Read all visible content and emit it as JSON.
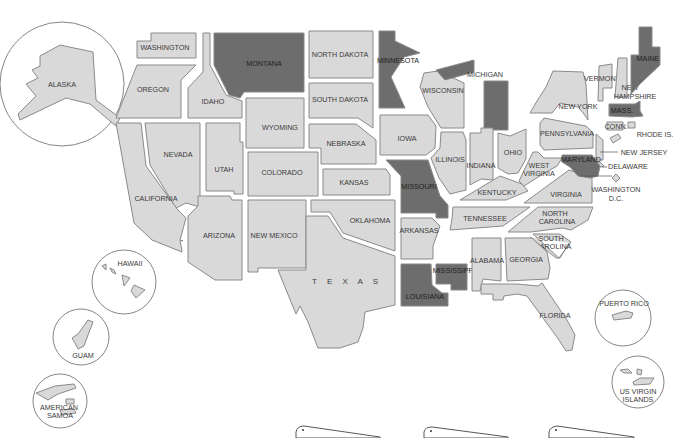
{
  "map": {
    "title": "United States Map",
    "colors": {
      "default_state": "#d9d9d9",
      "highlighted_state": "#6d6d6d",
      "border": "#8a8a8a",
      "background": "#ffffff"
    },
    "highlighted_states": [
      "MONTANA",
      "MINNESOTA",
      "MICHIGAN",
      "MISSOURI",
      "MISSISSIPPI",
      "LOUISIANA",
      "MAINE",
      "MASS.",
      "MARYLAND"
    ],
    "states": {
      "washington": "WASHINGTON",
      "oregon": "OREGON",
      "california": "CALIFORNIA",
      "idaho": "IDAHO",
      "nevada": "NEVADA",
      "montana": "MONTANA",
      "wyoming": "WYOMING",
      "utah": "UTAH",
      "arizona": "ARIZONA",
      "colorado": "COLORADO",
      "new_mexico": "NEW MEXICO",
      "north_dakota": "NORTH DAKOTA",
      "south_dakota": "SOUTH DAKOTA",
      "nebraska": "NEBRASKA",
      "kansas": "KANSAS",
      "oklahoma": "OKLAHOMA",
      "texas": "T E X A S",
      "minnesota": "MINNESOTA",
      "iowa": "IOWA",
      "missouri": "MISSOURI",
      "arkansas": "ARKANSAS",
      "louisiana": "LOUISIANA",
      "wisconsin": "WISCONSIN",
      "illinois": "ILLINOIS",
      "michigan": "MICHIGAN",
      "indiana": "INDIANA",
      "ohio": "OHIO",
      "kentucky": "KENTUCKY",
      "tennessee": "TENNESSEE",
      "mississippi": "MISSISSIPPI",
      "alabama": "ALABAMA",
      "georgia": "GEORGIA",
      "florida": "FLORIDA",
      "south_carolina_1": "SOUTH",
      "south_carolina_2": "CAROLINA",
      "north_carolina_1": "NORTH",
      "north_carolina_2": "CAROLINA",
      "virginia": "VIRGINIA",
      "west_virginia_1": "WEST",
      "west_virginia_2": "VIRGINIA",
      "pennsylvania": "PENNSYLVANIA",
      "new_york": "NEW YORK",
      "vermont": "VERMONT",
      "new_hampshire_1": "NEW",
      "new_hampshire_2": "HAMPSHIRE",
      "maine": "MAINE",
      "massachusetts": "MASS.",
      "connecticut": "CONN.",
      "rhode_island": "RHODE IS.",
      "new_jersey": "NEW JERSEY",
      "delaware": "DELAWARE",
      "maryland": "MARYLAND",
      "dc_1": "WASHINGTON",
      "dc_2": "D.C."
    },
    "insets": {
      "alaska": "ALASKA",
      "hawaii": "HAWAII",
      "guam": "GUAM",
      "american_samoa_1": "AMERICAN",
      "american_samoa_2": "SAMOA",
      "puerto_rico": "PUERTO RICO",
      "us_virgin_islands_1": "US VIRGIN",
      "us_virgin_islands_2": "ISLANDS"
    }
  }
}
